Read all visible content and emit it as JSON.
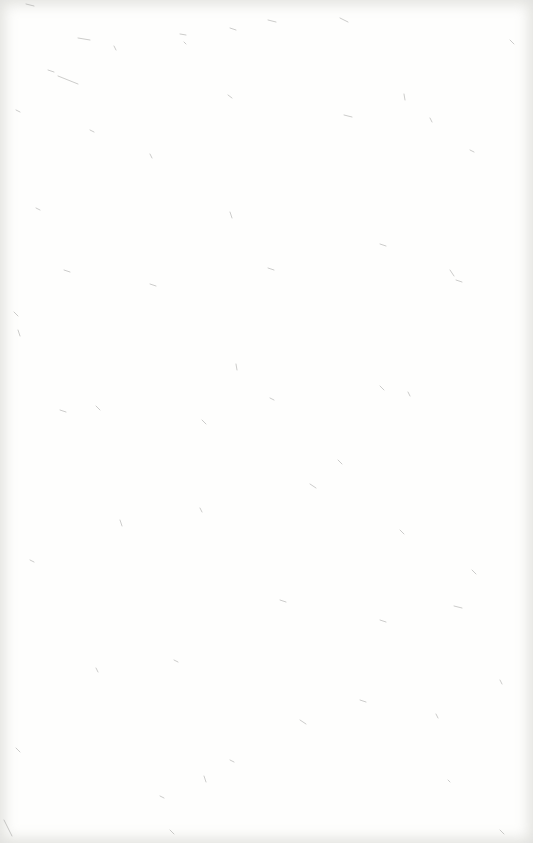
{
  "page": {
    "type": "blank-paper-texture",
    "background_color": "#fefefd",
    "fiber_color": "#8a8a88",
    "edge_shade_color": "#bebeb9"
  },
  "fibers": [
    [
      26,
      4,
      34,
      6
    ],
    [
      78,
      38,
      90,
      40
    ],
    [
      58,
      76,
      78,
      84
    ],
    [
      48,
      70,
      54,
      72
    ],
    [
      114,
      46,
      116,
      50
    ],
    [
      180,
      34,
      186,
      35
    ],
    [
      184,
      42,
      186,
      44
    ],
    [
      230,
      28,
      236,
      30
    ],
    [
      268,
      20,
      276,
      22
    ],
    [
      340,
      18,
      348,
      22
    ],
    [
      404,
      94,
      405,
      100
    ],
    [
      430,
      118,
      432,
      122
    ],
    [
      344,
      115,
      352,
      117
    ],
    [
      228,
      95,
      232,
      98
    ],
    [
      150,
      154,
      152,
      158
    ],
    [
      36,
      208,
      40,
      210
    ],
    [
      64,
      270,
      70,
      272
    ],
    [
      230,
      212,
      232,
      218
    ],
    [
      268,
      268,
      274,
      270
    ],
    [
      380,
      244,
      386,
      246
    ],
    [
      450,
      270,
      454,
      276
    ],
    [
      456,
      280,
      462,
      282
    ],
    [
      150,
      284,
      156,
      286
    ],
    [
      14,
      312,
      18,
      316
    ],
    [
      18,
      330,
      20,
      336
    ],
    [
      236,
      364,
      237,
      370
    ],
    [
      96,
      406,
      100,
      410
    ],
    [
      408,
      392,
      410,
      396
    ],
    [
      380,
      386,
      384,
      390
    ],
    [
      202,
      420,
      206,
      424
    ],
    [
      338,
      460,
      342,
      464
    ],
    [
      270,
      398,
      274,
      400
    ],
    [
      200,
      508,
      202,
      512
    ],
    [
      454,
      606,
      462,
      608
    ],
    [
      174,
      660,
      178,
      662
    ],
    [
      96,
      668,
      98,
      672
    ],
    [
      16,
      748,
      20,
      752
    ],
    [
      204,
      776,
      206,
      782
    ],
    [
      436,
      714,
      438,
      718
    ],
    [
      448,
      780,
      450,
      782
    ],
    [
      160,
      796,
      164,
      798
    ],
    [
      360,
      700,
      366,
      702
    ],
    [
      472,
      570,
      476,
      574
    ],
    [
      400,
      530,
      404,
      534
    ],
    [
      60,
      410,
      66,
      412
    ],
    [
      310,
      484,
      316,
      488
    ],
    [
      120,
      520,
      122,
      526
    ],
    [
      280,
      600,
      286,
      602
    ],
    [
      30,
      560,
      34,
      562
    ],
    [
      500,
      680,
      502,
      684
    ],
    [
      300,
      720,
      306,
      724
    ],
    [
      380,
      620,
      386,
      622
    ],
    [
      230,
      760,
      234,
      762
    ],
    [
      170,
      830,
      174,
      834
    ],
    [
      500,
      830,
      504,
      834
    ],
    [
      4,
      820,
      12,
      836
    ],
    [
      510,
      40,
      514,
      44
    ],
    [
      16,
      110,
      20,
      112
    ],
    [
      90,
      130,
      94,
      132
    ],
    [
      470,
      150,
      474,
      152
    ]
  ]
}
